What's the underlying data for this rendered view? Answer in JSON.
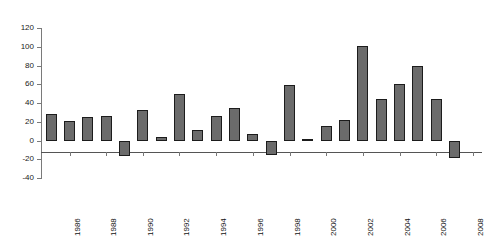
{
  "chart_data": {
    "type": "bar",
    "title": "",
    "subtitle": "",
    "xlabel": "",
    "ylabel": "",
    "ylim": [
      -40,
      120
    ],
    "ytick_step": 20,
    "yticks": [
      120,
      100,
      80,
      60,
      40,
      20,
      0,
      -20,
      -40
    ],
    "ytick_labels": [
      "120",
      "100",
      "80",
      "60",
      "40",
      "20",
      "0",
      "-20",
      "-40"
    ],
    "grid": false,
    "legend": false,
    "legend_position": "none",
    "bar_color": "#6b6b6b",
    "bar_edge_color": "#1c1c1c",
    "axis_color": "#777777",
    "background": "#ffffff",
    "categories": [
      "1985",
      "1986",
      "1987",
      "1988",
      "1989",
      "1990",
      "1991",
      "1992",
      "1993",
      "1994",
      "1995",
      "1996",
      "1997",
      "1998",
      "1999",
      "2000",
      "2001",
      "2002",
      "2003",
      "2004",
      "2005",
      "2006",
      "2007",
      "2008"
    ],
    "xtick_labels": [
      "1986",
      "1988",
      "1990",
      "1992",
      "1994",
      "1996",
      "1998",
      "2000",
      "2002",
      "2004",
      "2006",
      "2008"
    ],
    "values": [
      28,
      21,
      25,
      26,
      -17,
      33,
      4,
      50,
      11,
      26,
      35,
      7,
      -15,
      59,
      2,
      15,
      22,
      101,
      44,
      60,
      80,
      44,
      -19,
      0
    ],
    "series": [
      {
        "name": "annual value",
        "values": [
          28,
          21,
          25,
          26,
          -17,
          33,
          4,
          50,
          11,
          26,
          35,
          7,
          -15,
          59,
          2,
          15,
          22,
          101,
          44,
          60,
          80,
          44,
          -19,
          0
        ]
      }
    ]
  }
}
